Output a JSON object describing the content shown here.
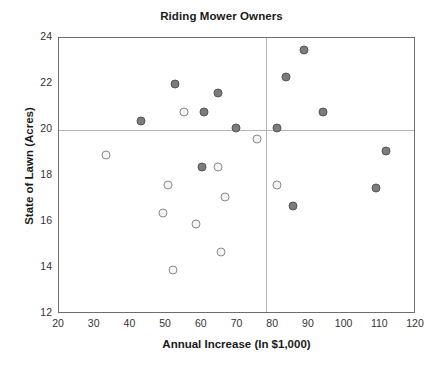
{
  "chart_data": {
    "type": "scatter",
    "title": "Riding Mower Owners",
    "xlabel": "Annual Increase (In $1,000)",
    "ylabel": "State of Lawn (Acres)",
    "xlim": [
      20,
      120
    ],
    "ylim": [
      12,
      24
    ],
    "xticks": [
      20,
      30,
      40,
      50,
      60,
      70,
      80,
      90,
      100,
      110,
      120
    ],
    "yticks": [
      12,
      14,
      16,
      18,
      20,
      22,
      24
    ],
    "grid": false,
    "legend": "none",
    "reference_lines": {
      "vertical_x": 78,
      "horizontal_y": 20
    },
    "series": [
      {
        "name": "Owners",
        "marker": "filled-circle",
        "color": "#7c7c7c",
        "points": [
          {
            "x": 43.0,
            "y": 20.4
          },
          {
            "x": 52.5,
            "y": 22.0
          },
          {
            "x": 60.5,
            "y": 20.8
          },
          {
            "x": 64.5,
            "y": 21.6
          },
          {
            "x": 69.5,
            "y": 20.1
          },
          {
            "x": 60.0,
            "y": 18.4
          },
          {
            "x": 81.0,
            "y": 20.1
          },
          {
            "x": 83.5,
            "y": 22.3
          },
          {
            "x": 88.5,
            "y": 23.5
          },
          {
            "x": 94.0,
            "y": 20.8
          },
          {
            "x": 85.5,
            "y": 16.7
          },
          {
            "x": 108.8,
            "y": 17.5
          },
          {
            "x": 111.6,
            "y": 19.1
          }
        ]
      },
      {
        "name": "Non-owners",
        "marker": "open-circle",
        "color": "#f4f4f4",
        "points": [
          {
            "x": 33.2,
            "y": 18.9
          },
          {
            "x": 55.0,
            "y": 20.8
          },
          {
            "x": 75.5,
            "y": 19.6
          },
          {
            "x": 50.5,
            "y": 17.6
          },
          {
            "x": 64.5,
            "y": 18.4
          },
          {
            "x": 49.0,
            "y": 16.4
          },
          {
            "x": 66.5,
            "y": 17.1
          },
          {
            "x": 58.5,
            "y": 15.9
          },
          {
            "x": 65.5,
            "y": 14.7
          },
          {
            "x": 52.0,
            "y": 13.9
          },
          {
            "x": 81.0,
            "y": 17.6
          }
        ]
      }
    ]
  }
}
